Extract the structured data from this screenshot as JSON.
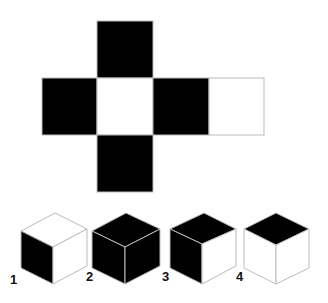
{
  "puzzle": {
    "type": "cube-net-folding",
    "net": {
      "faces": [
        {
          "position": "top",
          "color": "black"
        },
        {
          "position": "left",
          "color": "black"
        },
        {
          "position": "center",
          "color": "white"
        },
        {
          "position": "right",
          "color": "black"
        },
        {
          "position": "far-right",
          "color": "white"
        },
        {
          "position": "bottom",
          "color": "black"
        }
      ]
    },
    "options": [
      {
        "label": "1",
        "top": "white",
        "left": "black",
        "right": "white"
      },
      {
        "label": "2",
        "top": "black",
        "left": "black",
        "right": "black"
      },
      {
        "label": "3",
        "top": "black",
        "left": "black",
        "right": "white"
      },
      {
        "label": "4",
        "top": "black",
        "left": "white",
        "right": "white"
      }
    ]
  },
  "colors": {
    "black": "#000000",
    "white": "#ffffff",
    "edge": "#bbbbbb"
  }
}
